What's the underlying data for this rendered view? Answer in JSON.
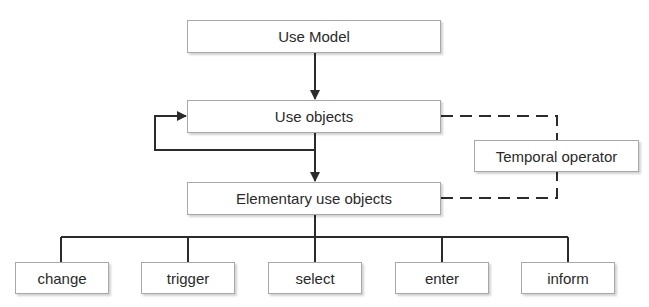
{
  "diagram": {
    "type": "hierarchy",
    "nodes": {
      "use_model": "Use Model",
      "use_objects": "Use objects",
      "elementary_use_objects": "Elementary use objects",
      "temporal_operator": "Temporal operator"
    },
    "leaves": [
      "change",
      "trigger",
      "select",
      "enter",
      "inform"
    ],
    "edges": [
      {
        "from": "Use Model",
        "to": "Use objects",
        "style": "solid-arrow"
      },
      {
        "from": "Use objects",
        "to": "Elementary use objects",
        "style": "solid-arrow"
      },
      {
        "from": "Use objects",
        "to": "Use objects",
        "style": "solid-arrow-loop"
      },
      {
        "from": "Use objects",
        "to": "Temporal operator",
        "style": "dashed"
      },
      {
        "from": "Elementary use objects",
        "to": "Temporal operator",
        "style": "dashed"
      },
      {
        "from": "Elementary use objects",
        "to": "change",
        "style": "solid"
      },
      {
        "from": "Elementary use objects",
        "to": "trigger",
        "style": "solid"
      },
      {
        "from": "Elementary use objects",
        "to": "select",
        "style": "solid"
      },
      {
        "from": "Elementary use objects",
        "to": "enter",
        "style": "solid"
      },
      {
        "from": "Elementary use objects",
        "to": "inform",
        "style": "solid"
      }
    ]
  },
  "colors": {
    "line": "#2b2b2b",
    "box_border": "#a8a8a8",
    "text": "#2a2a2a"
  }
}
